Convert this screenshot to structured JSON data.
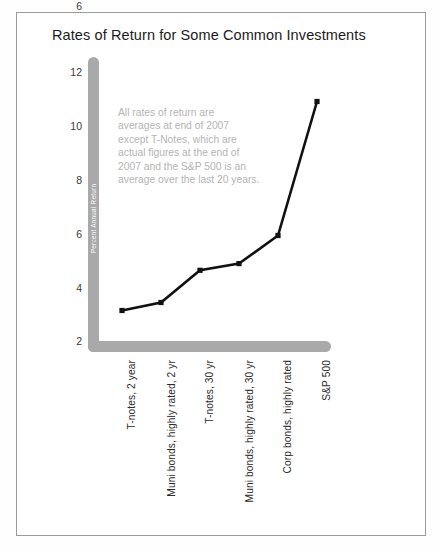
{
  "chart_data": {
    "type": "line",
    "title": "Rates of Return for Some Common Investments",
    "xlabel": "",
    "ylabel": "Percent Annual Return",
    "categories": [
      "T-notes, 2 year",
      "Muni bonds, highly rated, 2 yr",
      "T-notes, 30 yr",
      "Muni bonds, highly rated, 30 yr",
      "Corp bonds, highly rated",
      "S&P 500"
    ],
    "values": [
      3.1,
      3.4,
      4.6,
      4.85,
      5.9,
      10.9
    ],
    "series": [
      {
        "name": "Percent Annual Return",
        "values": [
          3.1,
          3.4,
          4.6,
          4.85,
          5.9,
          10.9
        ]
      }
    ],
    "ylim": [
      0,
      12.8
    ],
    "yticks": [
      2,
      4,
      6,
      8,
      10,
      12
    ],
    "ytick_labels": [
      "2",
      "4",
      "6",
      "8",
      "10",
      "12"
    ],
    "grid": false,
    "legend": "none",
    "marker": "square",
    "line_color": "#111111",
    "axis_color": "#a9a9a9",
    "annotation": "All rates of return are averages at end of 2007 except T-Notes, which are actual figures at the end of 2007 and the S&P 500 is an average over the last 20 years."
  },
  "note_lines": [
    "All rates of return are",
    "averages at end of 2007",
    "except T-Notes, which are",
    "actual figures at the end of",
    "2007 and the S&P 500 is an",
    "average over the last 20 years."
  ]
}
